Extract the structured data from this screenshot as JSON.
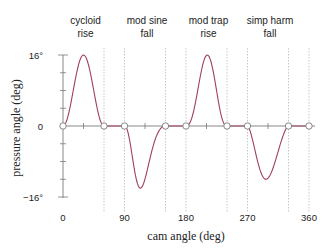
{
  "chart_data": {
    "type": "line",
    "title": "",
    "xlabel": "cam angle (deg)",
    "ylabel": "pressure angle (deg)",
    "xlim": [
      0,
      360
    ],
    "ylim": [
      -16,
      16
    ],
    "x_ticks": [
      0,
      90,
      180,
      270,
      360
    ],
    "x_tick_labels": [
      "0",
      "90",
      "180",
      "270",
      "360"
    ],
    "y_ticks": [
      -16,
      0,
      16
    ],
    "y_tick_labels": [
      "−16°",
      "0",
      "16°"
    ],
    "grid": false,
    "legend": null,
    "segment_boundaries": [
      60,
      90,
      150,
      180,
      240,
      270,
      330,
      360
    ],
    "segments": [
      {
        "label_line1": "cycloid",
        "label_line2": "rise",
        "start": 0,
        "end": 60,
        "extreme": 16
      },
      {
        "label_line1": "mod sine",
        "label_line2": "fall",
        "start": 90,
        "end": 150,
        "extreme": -14
      },
      {
        "label_line1": "mod trap",
        "label_line2": "rise",
        "start": 180,
        "end": 240,
        "extreme": 16
      },
      {
        "label_line1": "simp harm",
        "label_line2": "fall",
        "start": 270,
        "end": 330,
        "extreme": -12
      }
    ],
    "zero_markers": [
      0,
      60,
      90,
      150,
      180,
      240,
      270,
      330,
      360
    ],
    "series": [
      {
        "name": "pressure angle",
        "color": "#a0405a",
        "points": [
          [
            0,
            0
          ],
          [
            10,
            4.5
          ],
          [
            20,
            13
          ],
          [
            30,
            16
          ],
          [
            40,
            13
          ],
          [
            50,
            4.5
          ],
          [
            60,
            0
          ],
          [
            90,
            0
          ],
          [
            100,
            -3
          ],
          [
            110,
            -10
          ],
          [
            120,
            -14
          ],
          [
            130,
            -11
          ],
          [
            140,
            -5
          ],
          [
            150,
            0
          ],
          [
            180,
            0
          ],
          [
            190,
            6
          ],
          [
            200,
            14
          ],
          [
            210,
            16
          ],
          [
            220,
            12
          ],
          [
            230,
            5
          ],
          [
            240,
            0
          ],
          [
            270,
            0
          ],
          [
            280,
            -5
          ],
          [
            290,
            -10
          ],
          [
            300,
            -12
          ],
          [
            310,
            -10
          ],
          [
            320,
            -5
          ],
          [
            330,
            0
          ],
          [
            360,
            0
          ]
        ]
      }
    ]
  },
  "colors": {
    "curve": "#a0405a",
    "axis": "#7a7a7a",
    "dashed": "#b8b8b8",
    "marker": "#7a7a7a",
    "text": "#222222"
  }
}
